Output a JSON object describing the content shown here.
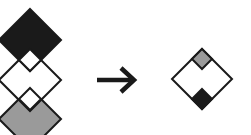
{
  "diagram": {
    "colors": {
      "black": "#1a1a1a",
      "gray": "#9a9a9a",
      "white": "#ffffff",
      "stroke": "#1a1a1a"
    },
    "left_stack": [
      {
        "id": "top",
        "fill": "black"
      },
      {
        "id": "middle",
        "fill": "white"
      },
      {
        "id": "bottom",
        "fill": "gray"
      }
    ],
    "arrow": {
      "direction": "right"
    },
    "result": {
      "outer_fill": "white",
      "top_inset_fill": "gray",
      "bottom_inset_fill": "black"
    }
  }
}
